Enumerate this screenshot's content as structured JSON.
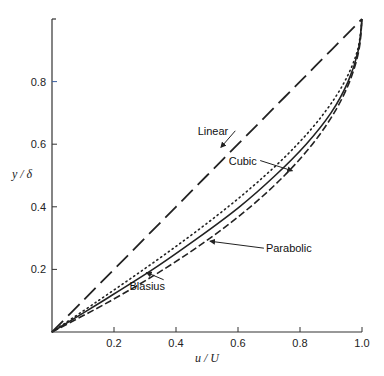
{
  "chart_data": {
    "type": "line",
    "title": "",
    "xlabel": "u / U",
    "ylabel": "y / δ",
    "xlim": [
      0,
      1.0
    ],
    "ylim": [
      0,
      1.0
    ],
    "grid": false,
    "legend": "inline labels with leader arrows",
    "x_ticks": [
      "0.2",
      "0.4",
      "0.6",
      "0.8",
      "1.0"
    ],
    "x_tick_values": [
      0.2,
      0.4,
      0.6,
      0.8,
      1.0
    ],
    "y_ticks": [
      "0.2",
      "0.4",
      "0.6",
      "0.8"
    ],
    "y_tick_values": [
      0.2,
      0.4,
      0.6,
      0.8
    ],
    "series": [
      {
        "name": "Linear",
        "style": "long-dash",
        "y": [
          0,
          0.1,
          0.2,
          0.3,
          0.4,
          0.5,
          0.6,
          0.7,
          0.8,
          0.9,
          1.0
        ],
        "x": [
          0,
          0.1,
          0.2,
          0.3,
          0.4,
          0.5,
          0.6,
          0.7,
          0.8,
          0.9,
          1.0
        ]
      },
      {
        "name": "Cubic",
        "style": "dotted",
        "y": [
          0,
          0.1,
          0.2,
          0.3,
          0.4,
          0.5,
          0.6,
          0.7,
          0.8,
          0.9,
          1.0
        ],
        "x": [
          0,
          0.1495,
          0.296,
          0.4365,
          0.568,
          0.6875,
          0.792,
          0.8785,
          0.944,
          0.9855,
          1.0
        ]
      },
      {
        "name": "Blasius",
        "style": "solid",
        "y": [
          0,
          0.1,
          0.2,
          0.3,
          0.4,
          0.5,
          0.6,
          0.7,
          0.8,
          0.9,
          1.0
        ],
        "x": [
          0,
          0.165,
          0.325,
          0.47,
          0.605,
          0.72,
          0.82,
          0.9,
          0.955,
          0.988,
          1.0
        ]
      },
      {
        "name": "Parabolic",
        "style": "short-dash",
        "y": [
          0,
          0.1,
          0.2,
          0.3,
          0.4,
          0.5,
          0.6,
          0.7,
          0.8,
          0.9,
          1.0
        ],
        "x": [
          0,
          0.19,
          0.36,
          0.51,
          0.64,
          0.75,
          0.84,
          0.91,
          0.96,
          0.99,
          1.0
        ]
      }
    ],
    "annotations": [
      {
        "text": "Linear",
        "x": 0.47,
        "y": 0.63,
        "arrow_to": [
          0.545,
          0.59
        ]
      },
      {
        "text": "Cubic",
        "x": 0.57,
        "y": 0.535,
        "arrow_to": [
          0.775,
          0.515
        ]
      },
      {
        "text": "Parabolic",
        "x": 0.69,
        "y": 0.255,
        "arrow_to": [
          0.51,
          0.29
        ]
      },
      {
        "text": "Blasius",
        "x": 0.25,
        "y": 0.135,
        "arrow_to": [
          0.305,
          0.19
        ]
      }
    ],
    "colors": {
      "axis": "#333333",
      "lines": "#222222",
      "highlight_tick": "#3b5fa0"
    }
  }
}
